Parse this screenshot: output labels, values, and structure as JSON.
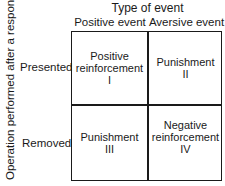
{
  "y_axis_label": "Operation performed after a response",
  "column_group_title": "Type of event",
  "columns": [
    "Positive event",
    "Aversive event"
  ],
  "rows": [
    "Presented",
    "Removed"
  ],
  "cells": [
    {
      "row": "Presented",
      "column": "Positive event",
      "label_line1": "Positive",
      "label_line2": "reinforcement",
      "numeral": "I"
    },
    {
      "row": "Presented",
      "column": "Aversive event",
      "label_line1": "Punishment",
      "label_line2": "",
      "numeral": "II"
    },
    {
      "row": "Removed",
      "column": "Positive event",
      "label_line1": "Punishment",
      "label_line2": "",
      "numeral": "III"
    },
    {
      "row": "Removed",
      "column": "Aversive event",
      "label_line1": "Negative",
      "label_line2": "reinforcement",
      "numeral": "IV"
    }
  ]
}
